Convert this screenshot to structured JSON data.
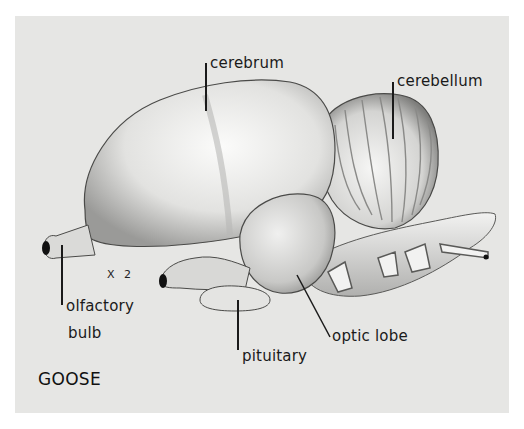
{
  "figure": {
    "title": "GOOSE",
    "scale": "X 2",
    "colors": {
      "background": "#e6e6e4",
      "tissue_light": "#f4f4f3",
      "tissue_mid": "#c9c9c7",
      "tissue_dark": "#8a8a88",
      "ink": "#1a1a1a"
    },
    "labels": {
      "cerebrum": "cerebrum",
      "cerebellum": "cerebellum",
      "olfactory_bulb_line1": "olfactory",
      "olfactory_bulb_line2": "bulb",
      "pituitary": "pituitary",
      "optic_lobe": "optic lobe"
    }
  }
}
